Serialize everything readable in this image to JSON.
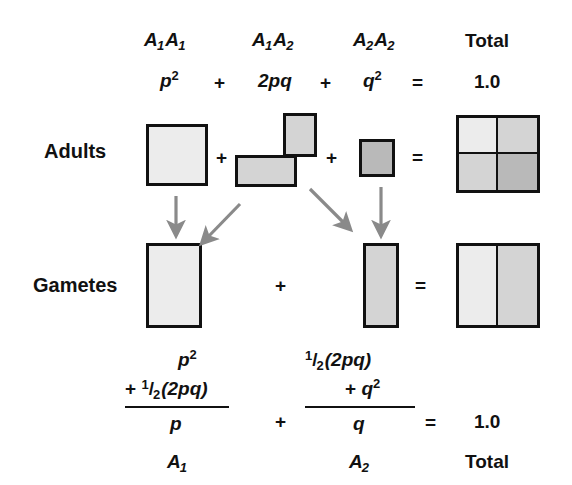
{
  "colors": {
    "shade_light": "#ececec",
    "shade_medium": "#d4d4d4",
    "shade_dark": "#b9b9b9",
    "outline": "#111111",
    "arrow": "#8a8a8a",
    "background": "#ffffff"
  },
  "header": {
    "genotypes": [
      {
        "allele1": "A",
        "sub1": "1",
        "allele2": "A",
        "sub2": "1"
      },
      {
        "allele1": "A",
        "sub1": "1",
        "allele2": "A",
        "sub2": "2"
      },
      {
        "allele1": "A",
        "sub1": "2",
        "allele2": "A",
        "sub2": "2"
      }
    ],
    "total_label": "Total"
  },
  "frequency_row": {
    "p_squared": "p",
    "p_squared_exp": "2",
    "plus_1": "+",
    "two_pq": "2pq",
    "plus_2": "+",
    "q_squared": "q",
    "q_squared_exp": "2",
    "equals": "=",
    "total_value": "1.0"
  },
  "rows": {
    "adults_label": "Adults",
    "gametes_label": "Gametes"
  },
  "adults_row": {
    "plus_1": "+",
    "plus_2": "+",
    "equals": "="
  },
  "gametes_row": {
    "plus_1": "+",
    "equals": "="
  },
  "bottom_equation": {
    "left": {
      "numerator_line1": "p",
      "numerator_line1_exp": "2",
      "numerator_line2_plus": "+",
      "numerator_line2_half_num": "1",
      "numerator_line2_half_slash": "/",
      "numerator_line2_half_den": "2",
      "numerator_line2_rest": "(2pq)",
      "denominator": "p",
      "allele": "A",
      "allele_sub": "1"
    },
    "middle_plus": "+",
    "right": {
      "numerator_line1_half_num": "1",
      "numerator_line1_half_slash": "/",
      "numerator_line1_half_den": "2",
      "numerator_line1_rest": "(2pq)",
      "numerator_line2_plus": "+",
      "numerator_line2_q": "q",
      "numerator_line2_exp": "2",
      "denominator": "q",
      "allele": "A",
      "allele_sub": "2"
    },
    "equals": "=",
    "total_value": "1.0",
    "total_label": "Total"
  }
}
